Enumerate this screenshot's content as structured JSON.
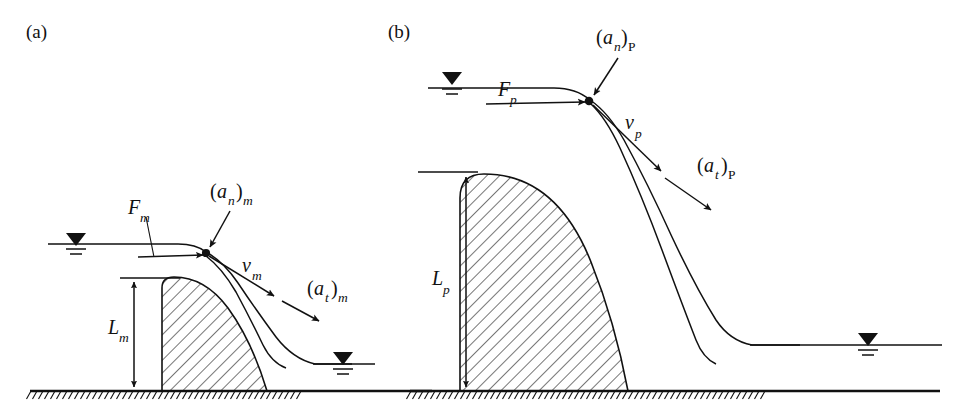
{
  "figure": {
    "background_color": "#ffffff",
    "ink_color": "#111111",
    "width": 968,
    "height": 417
  },
  "panels": [
    {
      "id": "a",
      "label": "(a)",
      "scale_kind": "model",
      "subscript": "m",
      "labels": {
        "force": "F",
        "force_sub": "m",
        "normal_accel_open": "(",
        "normal_accel_var": "a",
        "normal_accel_sub": "n",
        "normal_accel_close": ")",
        "normal_accel_scale_sub": "m",
        "velocity_var": "v",
        "velocity_sub": "m",
        "tangential_accel_open": "(",
        "tangential_accel_var": "a",
        "tangential_accel_sub": "t",
        "tangential_accel_close": ")",
        "tangential_accel_scale_sub": "m",
        "height_var": "L",
        "height_sub": "m"
      },
      "annotations": {
        "dimension_name": "L_m",
        "dimension_description": "dam height, model scale",
        "upstream_water_symbol": "water-level-triangle",
        "downstream_water_symbol": "water-level-triangle",
        "ground_symbol": "hatched-ground-line"
      }
    },
    {
      "id": "b",
      "label": "(b)",
      "scale_kind": "prototype",
      "subscript": "P",
      "labels": {
        "force": "F",
        "force_sub": "p",
        "normal_accel_open": "(",
        "normal_accel_var": "a",
        "normal_accel_sub": "n",
        "normal_accel_close": ")",
        "normal_accel_scale_sub": "P",
        "velocity_var": "v",
        "velocity_sub": "p",
        "tangential_accel_open": "(",
        "tangential_accel_var": "a",
        "tangential_accel_sub": "t",
        "tangential_accel_close": ")",
        "tangential_accel_scale_sub": "P",
        "height_var": "L",
        "height_sub": "p"
      },
      "annotations": {
        "dimension_name": "L_p",
        "dimension_description": "dam height, prototype scale",
        "upstream_water_symbol": "water-level-triangle",
        "downstream_water_symbol": "water-level-triangle",
        "ground_symbol": "hatched-ground-line"
      }
    }
  ],
  "legend_semantics": {
    "F": "resultant force vector at crest node",
    "v": "flow velocity vector tangent to nappe",
    "a_n": "normal acceleration component",
    "a_t": "tangential acceleration component",
    "L": "characteristic length (dam height)"
  }
}
